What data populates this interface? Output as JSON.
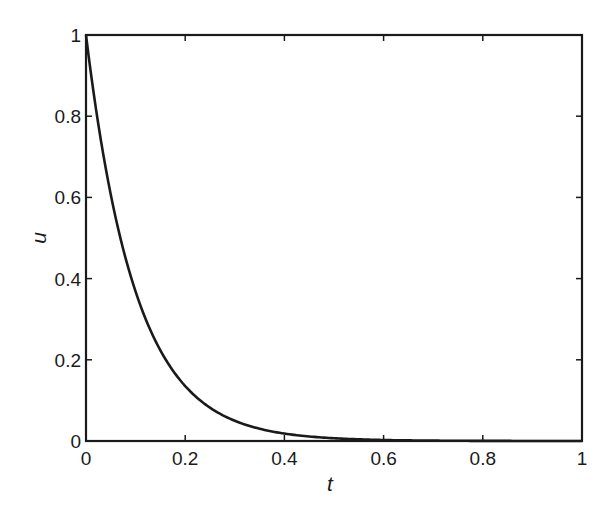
{
  "chart_data": {
    "type": "line",
    "title": "",
    "xlabel": "t",
    "ylabel": "u",
    "xlim": [
      0,
      1
    ],
    "ylim": [
      0,
      1
    ],
    "xticks": [
      "0",
      "0.2",
      "0.4",
      "0.6",
      "0.8",
      "1"
    ],
    "yticks": [
      "0",
      "0.2",
      "0.4",
      "0.6",
      "0.8",
      "1"
    ],
    "grid": false,
    "legend": null,
    "series": [
      {
        "name": "u(t)",
        "x": [
          0,
          0.05,
          0.1,
          0.15,
          0.2,
          0.25,
          0.3,
          0.35,
          0.4,
          0.5,
          0.6,
          0.7,
          0.8,
          0.9,
          1.0
        ],
        "values": [
          1.0,
          0.61,
          0.37,
          0.22,
          0.14,
          0.08,
          0.05,
          0.03,
          0.02,
          0.007,
          0.002,
          0.001,
          0.0,
          0.0,
          0.0
        ]
      }
    ]
  }
}
